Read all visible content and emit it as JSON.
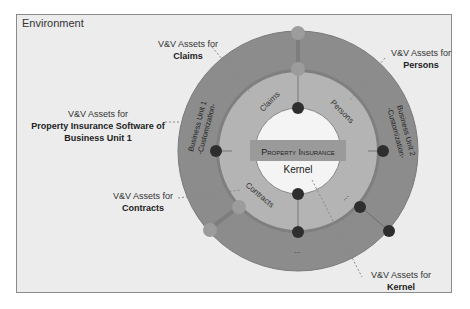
{
  "environment": {
    "label": "Environment"
  },
  "center": {
    "title": "Property Insurance",
    "subtitle": "Kernel"
  },
  "inner_ring": {
    "segments": [
      "Claims",
      "Persons",
      "Contracts",
      "..."
    ]
  },
  "outer_ring": {
    "segments": [
      "Business Unit 1 -Customization-",
      "Business Unit 2 -Customization-",
      "..."
    ]
  },
  "callouts": [
    {
      "id": "claims",
      "prefix": "V&V Assets for",
      "target": "Claims"
    },
    {
      "id": "persons",
      "prefix": "V&V Assets for",
      "target": "Persons"
    },
    {
      "id": "bu1",
      "prefix": "V&V Assets for",
      "target": "Property Insurance Software of Business Unit 1"
    },
    {
      "id": "contracts",
      "prefix": "V&V Assets for",
      "target": "Contracts"
    },
    {
      "id": "kernel",
      "prefix": "V&V Assets for",
      "target": "Kernel"
    }
  ],
  "colors": {
    "outer_ring": "#8c8c8c",
    "inner_ring": "#b4b4b4",
    "kernel": "#f4f4f4",
    "band": "#9a9a9a",
    "node_dark": "#2e2e2e",
    "node_light": "#9c9c9c",
    "background": "#ececec"
  }
}
